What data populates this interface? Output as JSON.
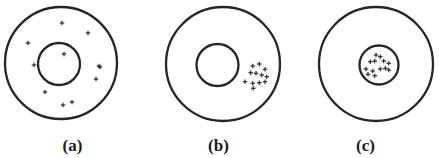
{
  "figure": {
    "background_color": "#ffffff",
    "stroke_color": "#262626",
    "label_color": "#1b1b1b",
    "charge_symbol": "+",
    "width": 439,
    "height": 158
  },
  "panels": [
    {
      "id": "a",
      "label": "(a)",
      "left": 0,
      "width": 145,
      "outer_circle": {
        "cx": 61,
        "cy": 63,
        "r": 56,
        "stroke_width": 2.3
      },
      "inner_circle": {
        "cx": 59,
        "cy": 64,
        "r": 21,
        "stroke_width": 2.3
      },
      "charge_count": 11,
      "charge_size": 4.6,
      "charges": [
        {
          "x": 62,
          "y": 23
        },
        {
          "x": 88,
          "y": 33
        },
        {
          "x": 28,
          "y": 43
        },
        {
          "x": 64,
          "y": 54
        },
        {
          "x": 99,
          "y": 66
        },
        {
          "x": 34,
          "y": 65
        },
        {
          "x": 96,
          "y": 79
        },
        {
          "x": 45,
          "y": 92
        },
        {
          "x": 72,
          "y": 102
        },
        {
          "x": 63,
          "y": 105
        },
        {
          "x": 100,
          "y": 67
        }
      ]
    },
    {
      "id": "b",
      "label": "(b)",
      "left": 145,
      "width": 147,
      "outer_circle": {
        "cx": 78,
        "cy": 64,
        "r": 57,
        "stroke_width": 2.3
      },
      "inner_circle": {
        "cx": 72.5,
        "cy": 65,
        "r": 21,
        "stroke_width": 2.3
      },
      "charge_count": 12,
      "charge_size": 4.6,
      "charges": [
        {
          "x": 107.7,
          "y": 66
        },
        {
          "x": 114.3,
          "y": 64
        },
        {
          "x": 120,
          "y": 69.3
        },
        {
          "x": 105.7,
          "y": 72.7
        },
        {
          "x": 111,
          "y": 73.3
        },
        {
          "x": 116.7,
          "y": 75
        },
        {
          "x": 121.7,
          "y": 76.7
        },
        {
          "x": 100,
          "y": 81.7
        },
        {
          "x": 107.7,
          "y": 83.3
        },
        {
          "x": 114.3,
          "y": 82.7
        },
        {
          "x": 120,
          "y": 81.7
        },
        {
          "x": 108.3,
          "y": 88.3
        }
      ]
    },
    {
      "id": "c",
      "label": "(c)",
      "left": 292,
      "width": 147,
      "outer_circle": {
        "cx": 84,
        "cy": 64,
        "r": 57,
        "stroke_width": 2.3
      },
      "inner_circle": {
        "cx": 87,
        "cy": 65,
        "r": 19.5,
        "stroke_width": 2.3
      },
      "charge_count": 13,
      "charge_size": 4.6,
      "charges": [
        {
          "x": 84,
          "y": 55
        },
        {
          "x": 88.3,
          "y": 56.7
        },
        {
          "x": 78.3,
          "y": 61.7
        },
        {
          "x": 82.7,
          "y": 61
        },
        {
          "x": 91.7,
          "y": 61
        },
        {
          "x": 96.7,
          "y": 63.3
        },
        {
          "x": 74,
          "y": 69
        },
        {
          "x": 80.7,
          "y": 71
        },
        {
          "x": 88.3,
          "y": 69
        },
        {
          "x": 93.3,
          "y": 68.3
        },
        {
          "x": 96.7,
          "y": 70
        },
        {
          "x": 76,
          "y": 74.3
        },
        {
          "x": 82.7,
          "y": 75.7
        }
      ]
    }
  ]
}
